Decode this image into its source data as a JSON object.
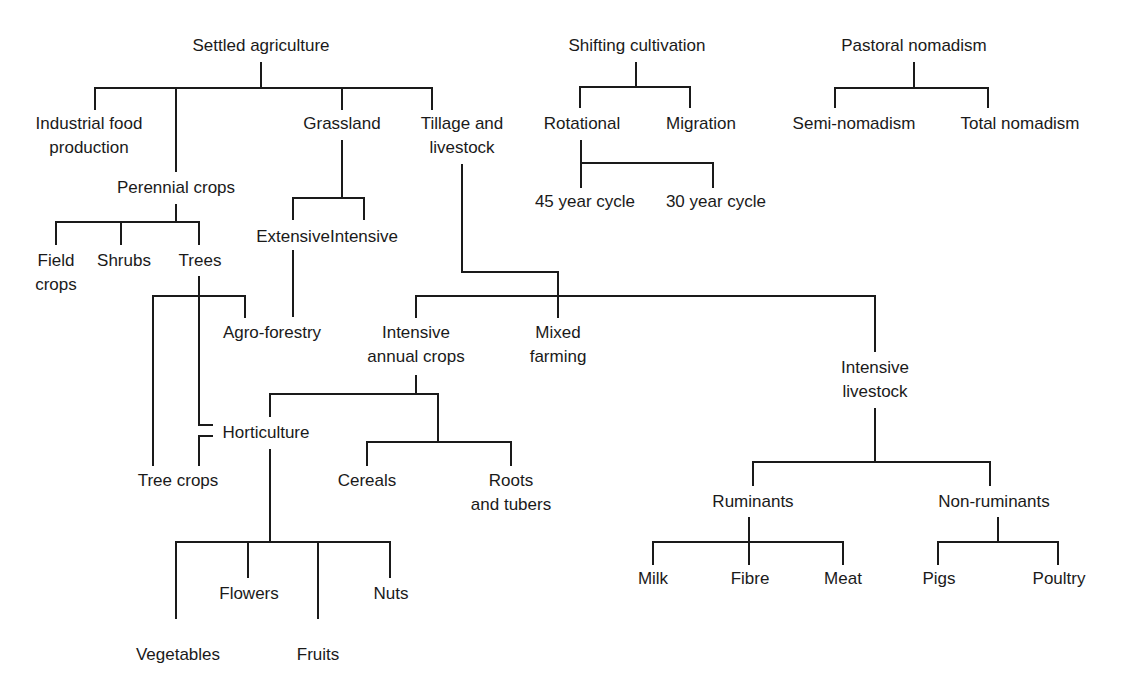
{
  "nodes": {
    "settled": {
      "lines": [
        "Settled agriculture"
      ],
      "x": 261,
      "y": 34
    },
    "industrial": {
      "lines": [
        "Industrial food",
        "production"
      ],
      "x": 89,
      "y": 112
    },
    "perennial": {
      "lines": [
        "Perennial crops"
      ],
      "x": 176,
      "y": 176
    },
    "grassland": {
      "lines": [
        "Grassland"
      ],
      "x": 342,
      "y": 112
    },
    "tillage": {
      "lines": [
        "Tillage and",
        "livestock"
      ],
      "x": 462,
      "y": 112
    },
    "field_crops": {
      "lines": [
        "Field",
        "crops"
      ],
      "x": 56,
      "y": 249
    },
    "shrubs": {
      "lines": [
        "Shrubs"
      ],
      "x": 124,
      "y": 249
    },
    "trees": {
      "lines": [
        "Trees"
      ],
      "x": 188,
      "y": 249
    },
    "extensive": {
      "lines": [
        "Extensive"
      ],
      "x": 293,
      "y": 225
    },
    "intensive_grass": {
      "lines": [
        "Intensive"
      ],
      "x": 364,
      "y": 225
    },
    "agroforestry": {
      "lines": [
        "Agro-forestry"
      ],
      "x": 272,
      "y": 321
    },
    "int_annual": {
      "lines": [
        "Intensive",
        "annual crops"
      ],
      "x": 362,
      "y": 321
    },
    "mixed": {
      "lines": [
        "Mixed",
        "farming"
      ],
      "x": 486,
      "y": 321
    },
    "int_livestock": {
      "lines": [
        "Intensive",
        "livestock"
      ],
      "x": 852,
      "y": 356
    },
    "horticulture": {
      "lines": [
        "Horticulture"
      ],
      "x": 258,
      "y": 421
    },
    "tree_crops": {
      "lines": [
        "Tree crops"
      ],
      "x": 178,
      "y": 469
    },
    "cereals": {
      "lines": [
        "Cereals"
      ],
      "x": 319,
      "y": 469
    },
    "roots": {
      "lines": [
        "Roots",
        "and tubers"
      ],
      "x": 445,
      "y": 469
    },
    "ruminants": {
      "lines": [
        "Ruminants"
      ],
      "x": 736,
      "y": 490
    },
    "non_ruminants": {
      "lines": [
        "Non-ruminants"
      ],
      "x": 972,
      "y": 490
    },
    "milk": {
      "lines": [
        "Milk"
      ],
      "x": 653,
      "y": 567
    },
    "fibre": {
      "lines": [
        "Fibre"
      ],
      "x": 750,
      "y": 567
    },
    "meat": {
      "lines": [
        "Meat"
      ],
      "x": 843,
      "y": 567
    },
    "pigs": {
      "lines": [
        "Pigs"
      ],
      "x": 938,
      "y": 567
    },
    "poultry": {
      "lines": [
        "Poultry"
      ],
      "x": 1058,
      "y": 567
    },
    "flowers": {
      "lines": [
        "Flowers"
      ],
      "x": 249,
      "y": 582
    },
    "nuts": {
      "lines": [
        "Nuts"
      ],
      "x": 391,
      "y": 582
    },
    "vegetables": {
      "lines": [
        "Vegetables"
      ],
      "x": 178,
      "y": 643
    },
    "fruits": {
      "lines": [
        "Fruits"
      ],
      "x": 318,
      "y": 643
    },
    "shifting": {
      "lines": [
        "Shifting cultivation"
      ],
      "x": 640,
      "y": 34
    },
    "rotational": {
      "lines": [
        "Rotational"
      ],
      "x": 582,
      "y": 112
    },
    "migration": {
      "lines": [
        "Migration"
      ],
      "x": 701,
      "y": 112
    },
    "cycle45": {
      "lines": [
        "45 year cycle"
      ],
      "x": 584,
      "y": 190
    },
    "cycle30": {
      "lines": [
        "30 year cycle"
      ],
      "x": 716,
      "y": 190
    },
    "pastoral": {
      "lines": [
        "Pastoral nomadism"
      ],
      "x": 914,
      "y": 34
    },
    "semi": {
      "lines": [
        "Semi-nomadism"
      ],
      "x": 854,
      "y": 112
    },
    "total": {
      "lines": [
        "Total nomadism"
      ],
      "x": 1019,
      "y": 112
    }
  }
}
